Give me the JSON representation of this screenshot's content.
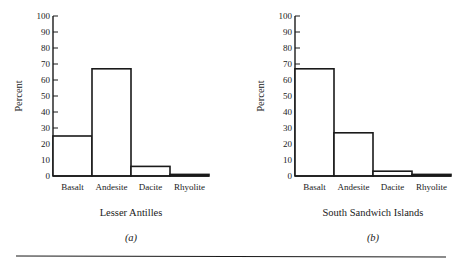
{
  "chart_data": [
    {
      "type": "bar",
      "panel": "(a)",
      "title": "Lesser Antilles",
      "xlabel": "",
      "ylabel": "Percent",
      "categories": [
        "Basalt",
        "Andesite",
        "Dacite",
        "Rhyolite"
      ],
      "values": [
        25,
        67,
        6,
        1
      ],
      "ylim": [
        0,
        100
      ],
      "yticks": [
        0,
        10,
        20,
        30,
        40,
        50,
        60,
        70,
        80,
        90,
        100
      ],
      "grid": false,
      "legend": null
    },
    {
      "type": "bar",
      "panel": "(b)",
      "title": "South Sandwich Islands",
      "xlabel": "",
      "ylabel": "Percent",
      "categories": [
        "Basalt",
        "Andesite",
        "Dacite",
        "Rhyolite"
      ],
      "values": [
        67,
        27,
        3,
        1
      ],
      "ylim": [
        0,
        100
      ],
      "yticks": [
        0,
        10,
        20,
        30,
        40,
        50,
        60,
        70,
        80,
        90,
        100
      ],
      "grid": false,
      "legend": null
    }
  ],
  "colors": {
    "ink": "#1a1a1a",
    "background": "#ffffff"
  }
}
